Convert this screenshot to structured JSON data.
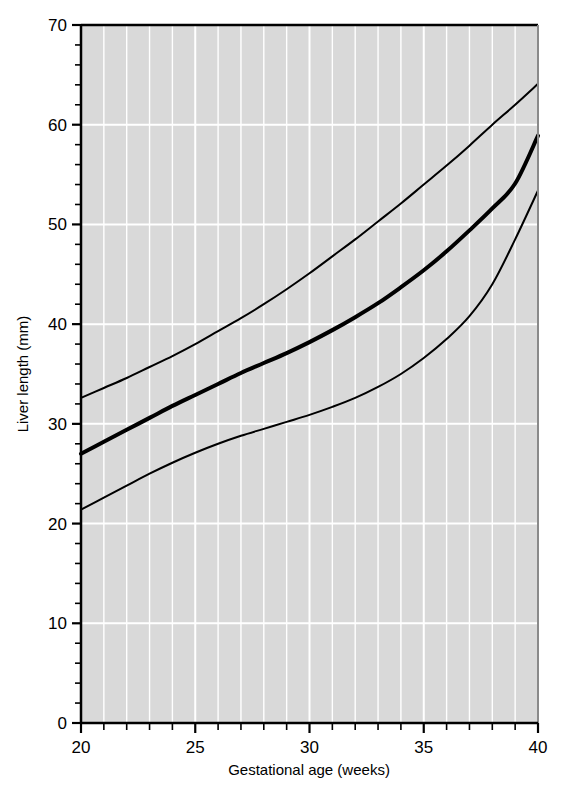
{
  "chart_data": {
    "type": "line",
    "title": "",
    "subtitle": "",
    "xlabel": "Gestational age (weeks)",
    "ylabel": "Liver length (mm)",
    "xlim": [
      20,
      40
    ],
    "ylim": [
      0,
      70
    ],
    "x_major_ticks": [
      20,
      25,
      30,
      35,
      40
    ],
    "x_major_tick_labels": [
      "20",
      "25",
      "30",
      "35",
      "40"
    ],
    "x_minor_tick_step": 1,
    "y_major_ticks": [
      0,
      10,
      20,
      30,
      40,
      50,
      60,
      70
    ],
    "y_major_tick_labels": [
      "0",
      "10",
      "20",
      "30",
      "40",
      "50",
      "60",
      "70"
    ],
    "y_minor_tick_step": 2,
    "grid": true,
    "grid_color": "#ffffff",
    "plot_background": "#d9d9d9",
    "legend": "none",
    "line_color": "#000000",
    "x": [
      20,
      21,
      22,
      23,
      24,
      25,
      26,
      27,
      28,
      29,
      30,
      31,
      32,
      33,
      34,
      35,
      36,
      37,
      38,
      39,
      40
    ],
    "series": [
      {
        "name": "95th centile",
        "line_width_px": 2,
        "values": [
          32.6,
          33.6,
          34.6,
          35.7,
          36.8,
          38.0,
          39.3,
          40.6,
          42.0,
          43.5,
          45.1,
          46.8,
          48.5,
          50.3,
          52.1,
          54.0,
          55.9,
          57.9,
          60.0,
          62.0,
          64.1
        ]
      },
      {
        "name": "50th centile",
        "line_width_px": 4,
        "values": [
          27.0,
          28.2,
          29.4,
          30.6,
          31.8,
          32.9,
          34.0,
          35.1,
          36.1,
          37.1,
          38.2,
          39.4,
          40.7,
          42.1,
          43.7,
          45.4,
          47.3,
          49.4,
          51.6,
          54.1,
          58.9
        ]
      },
      {
        "name": "5th centile",
        "line_width_px": 2,
        "values": [
          21.4,
          22.6,
          23.8,
          25.0,
          26.1,
          27.1,
          28.0,
          28.8,
          29.5,
          30.2,
          30.9,
          31.7,
          32.6,
          33.7,
          35.0,
          36.6,
          38.5,
          40.8,
          44.0,
          48.5,
          53.4
        ]
      }
    ]
  },
  "axes": {
    "x_axis_name": "Gestational age (weeks)",
    "y_axis_name": "Liver length (mm)"
  }
}
